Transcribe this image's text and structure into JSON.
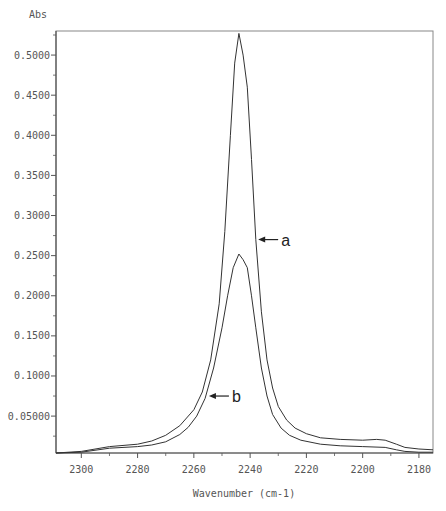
{
  "chart_data": {
    "type": "line",
    "title": "",
    "xlabel": "Wavenumber (cm-1)",
    "ylabel": "Abs",
    "xlim": [
      2309,
      2175
    ],
    "ylim": [
      0.004,
      0.53
    ],
    "x_reversed": true,
    "grid": false,
    "legend": "none",
    "x_ticks": [
      2300,
      2280,
      2260,
      2240,
      2220,
      2200,
      2180
    ],
    "x_tick_labels": [
      "2300",
      "2280",
      "2260",
      "2240",
      "2220",
      "2200",
      "2180"
    ],
    "y_ticks": [
      0.05,
      0.1,
      0.15,
      0.2,
      0.25,
      0.3,
      0.35,
      0.4,
      0.45,
      0.5
    ],
    "y_tick_labels": [
      "0.05000",
      "0.1000",
      "0.1500",
      "0.2000",
      "0.2500",
      "0.3000",
      "0.3500",
      "0.4000",
      "0.4500",
      "0.5000"
    ],
    "series": [
      {
        "name": "a",
        "x": [
          2309,
          2300,
          2290,
          2280,
          2275,
          2270,
          2265,
          2260,
          2257,
          2254,
          2251,
          2249,
          2247,
          2245.5,
          2244,
          2242.5,
          2241,
          2239.5,
          2238,
          2236,
          2234,
          2232,
          2230,
          2227,
          2224,
          2220,
          2215,
          2208,
          2200,
          2195,
          2192,
          2188,
          2185,
          2180,
          2175
        ],
        "values": [
          0.004,
          0.006,
          0.012,
          0.015,
          0.019,
          0.026,
          0.038,
          0.058,
          0.08,
          0.12,
          0.19,
          0.28,
          0.4,
          0.49,
          0.527,
          0.5,
          0.46,
          0.37,
          0.27,
          0.18,
          0.12,
          0.085,
          0.062,
          0.045,
          0.035,
          0.028,
          0.023,
          0.021,
          0.02,
          0.021,
          0.02,
          0.015,
          0.011,
          0.009,
          0.008
        ]
      },
      {
        "name": "b",
        "x": [
          2309,
          2300,
          2290,
          2280,
          2275,
          2270,
          2265,
          2262,
          2259,
          2256,
          2253,
          2250,
          2248,
          2246,
          2244,
          2242.5,
          2241,
          2239.5,
          2238,
          2236,
          2234,
          2232,
          2229,
          2226,
          2222,
          2215,
          2208,
          2200,
          2192,
          2188,
          2185,
          2180,
          2175
        ],
        "values": [
          0.004,
          0.005,
          0.01,
          0.012,
          0.014,
          0.018,
          0.027,
          0.036,
          0.05,
          0.072,
          0.11,
          0.16,
          0.2,
          0.235,
          0.252,
          0.245,
          0.235,
          0.2,
          0.16,
          0.11,
          0.075,
          0.052,
          0.035,
          0.026,
          0.02,
          0.015,
          0.013,
          0.012,
          0.011,
          0.008,
          0.006,
          0.005,
          0.005
        ]
      }
    ],
    "annotations": [
      {
        "text": "a",
        "arrow_to_x": 2237.5,
        "arrow_to_y": 0.27
      },
      {
        "text": "b",
        "arrow_to_x": 2255,
        "arrow_to_y": 0.075
      }
    ]
  },
  "layout": {
    "frame": {
      "left": 56,
      "top": 31,
      "right": 433,
      "bottom": 453
    },
    "line_color": "#333333",
    "axis_color": "#555555"
  }
}
